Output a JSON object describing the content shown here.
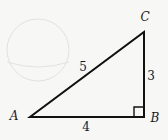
{
  "figure": {
    "type": "right-triangle",
    "vertices": {
      "A": {
        "label": "A",
        "x": 30,
        "y": 117,
        "label_x": 14,
        "label_y": 116
      },
      "B": {
        "label": "B",
        "x": 144,
        "y": 117,
        "label_x": 155,
        "label_y": 118
      },
      "C": {
        "label": "C",
        "x": 144,
        "y": 32,
        "label_x": 145,
        "label_y": 17
      }
    },
    "sides": {
      "AC": {
        "label": "5",
        "x": 83,
        "y": 67
      },
      "BC": {
        "label": "3",
        "x": 151,
        "y": 76
      },
      "AB": {
        "label": "4",
        "x": 86,
        "y": 127
      }
    },
    "right_angle_at": "B",
    "right_angle_marker_size": 10,
    "stroke_color": "#111111",
    "background_color": "#f7f7f5",
    "ghost_circle": {
      "cx": 38,
      "cy": 50,
      "r": 31,
      "color": "#e3e3e0"
    }
  }
}
